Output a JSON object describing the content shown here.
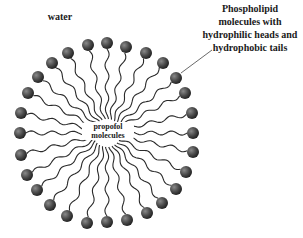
{
  "diagram": {
    "labels": {
      "water": "water",
      "phospholipid_line1": "Phospholipid",
      "phospholipid_line2": "molecules with",
      "phospholipid_line3": "hydrophilic heads and",
      "phospholipid_line4": "hydrophobic tails",
      "core_line1": "propofol",
      "core_line2": "molecules"
    },
    "center": [
      107,
      133
    ],
    "head_radius": 6,
    "head_color": "#3a3a3a",
    "tail_color": "#2a2a2a",
    "heads": [
      [
        107,
        43
      ],
      [
        126,
        47
      ],
      [
        146,
        53
      ],
      [
        163,
        63
      ],
      [
        176,
        78
      ],
      [
        185,
        93
      ],
      [
        192,
        113
      ],
      [
        193,
        133
      ],
      [
        193,
        152
      ],
      [
        186,
        172
      ],
      [
        176,
        189
      ],
      [
        162,
        203
      ],
      [
        147,
        213
      ],
      [
        127,
        220
      ],
      [
        107,
        222
      ],
      [
        87,
        223
      ],
      [
        67,
        216
      ],
      [
        50,
        205
      ],
      [
        37,
        190
      ],
      [
        27,
        175
      ],
      [
        21,
        155
      ],
      [
        20,
        133
      ],
      [
        21,
        113
      ],
      [
        28,
        93
      ],
      [
        38,
        77
      ],
      [
        52,
        63
      ],
      [
        68,
        53
      ],
      [
        88,
        45
      ]
    ],
    "leader_line": {
      "from": [
        181,
        73
      ],
      "to": [
        212,
        50
      ]
    }
  }
}
